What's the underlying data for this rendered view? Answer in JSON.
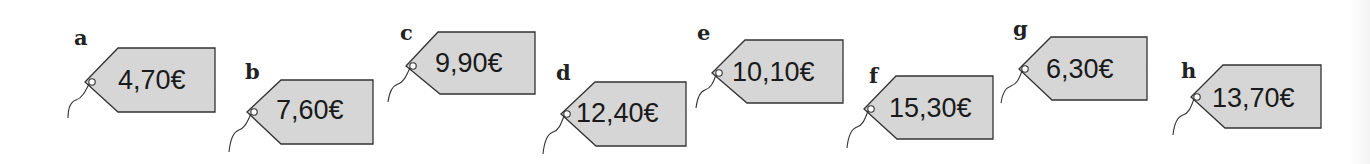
{
  "colors": {
    "tag_fill": "#d6d6d6",
    "tag_stroke": "#333333",
    "text": "#1a1a1a"
  },
  "tags": [
    {
      "letter": "a",
      "price": "4,70€"
    },
    {
      "letter": "b",
      "price": "7,60€"
    },
    {
      "letter": "c",
      "price": "9,90€"
    },
    {
      "letter": "d",
      "price": "12,40€"
    },
    {
      "letter": "e",
      "price": "10,10€"
    },
    {
      "letter": "f",
      "price": "15,30€"
    },
    {
      "letter": "g",
      "price": "6,30€"
    },
    {
      "letter": "h",
      "price": "13,70€"
    }
  ]
}
